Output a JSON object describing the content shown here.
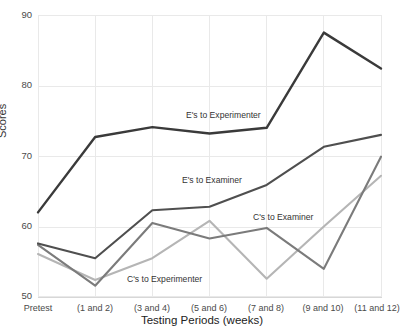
{
  "chart_data": {
    "type": "line",
    "title": "",
    "xlabel": "Testing Periods (weeks)",
    "ylabel": "Scores",
    "categories": [
      "Pretest",
      "(1 and 2)",
      "(3 and 4)",
      "(5 and 6)",
      "(7 and 8)",
      "(9 and 10)",
      "(11 and 12)"
    ],
    "ylim": [
      50,
      90
    ],
    "yticks": [
      50,
      60,
      70,
      80,
      90
    ],
    "grid": true,
    "legend_position": "inline-annotations",
    "series": [
      {
        "name": "E's to Experimenter",
        "color": "#3a3a3a",
        "values": [
          62.0,
          72.7,
          74.1,
          73.2,
          74.0,
          87.5,
          82.4
        ]
      },
      {
        "name": "E's to Examiner",
        "color": "#4f4f4f",
        "values": [
          57.6,
          55.5,
          62.3,
          62.8,
          65.9,
          71.3,
          73.0
        ]
      },
      {
        "name": "C's to Examiner",
        "color": "#7b7b7b",
        "values": [
          57.4,
          51.6,
          60.5,
          58.3,
          59.8,
          54.0,
          69.9
        ]
      },
      {
        "name": "C's to Experimenter",
        "color": "#b5b5b5",
        "values": [
          56.1,
          52.4,
          55.5,
          60.8,
          52.6,
          60.0,
          67.2
        ]
      }
    ],
    "annotations": [
      {
        "text": "E's to Experimenter",
        "x_px": 186,
        "y_px": 110
      },
      {
        "text": "E's to Examiner",
        "x_px": 182,
        "y_px": 175
      },
      {
        "text": "C's to Examiner",
        "x_px": 253,
        "y_px": 212
      },
      {
        "text": "C's to Experimenter",
        "x_px": 127,
        "y_px": 274
      }
    ]
  },
  "axes": {
    "ylabel": "Scores",
    "xlabel": "Testing Periods (weeks)",
    "ytick_labels": [
      "90",
      "80",
      "70",
      "60",
      "50"
    ],
    "xtick_labels": [
      "Pretest",
      "(1 and 2)",
      "(3 and 4)",
      "(5 and 6)",
      "(7 and 8)",
      "(9 and 10)",
      "(11 and 12)"
    ]
  },
  "clipped_title": ""
}
